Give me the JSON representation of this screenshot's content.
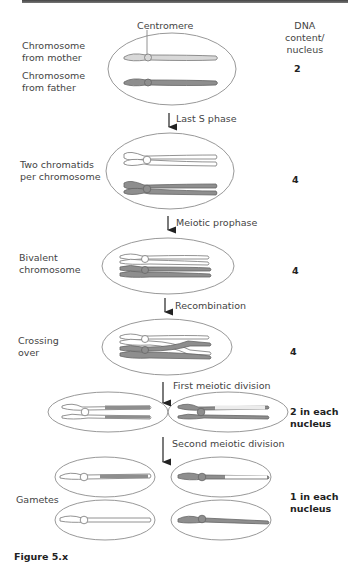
{
  "header": {
    "dna_label": "DNA\ncontent/\nnucleus"
  },
  "labels": {
    "centromere": "Centromere",
    "chrom_mother": "Chromosome\nfrom mother",
    "chrom_father": "Chromosome\nfrom father",
    "two_chromatids": "Two chromatids\nper chromosome",
    "bivalent": "Bivalent\nchromosome",
    "crossing_over": "Crossing\nover",
    "gametes": "Gametes"
  },
  "steps": [
    {
      "label": "Last S phase"
    },
    {
      "label": "Meiotic prophase"
    },
    {
      "label": "Recombination"
    },
    {
      "label": "First meiotic division"
    },
    {
      "label": "Second meiotic division"
    }
  ],
  "dna_content": [
    {
      "stage": "initial",
      "value": "2"
    },
    {
      "stage": "two_chromatids",
      "value": "4"
    },
    {
      "stage": "bivalent",
      "value": "4"
    },
    {
      "stage": "crossing_over",
      "value": "4"
    },
    {
      "stage": "first_division",
      "value": "2 in each\nnucleus"
    },
    {
      "stage": "gametes",
      "value": "1 in each\nnucleus"
    }
  ],
  "colors": {
    "maternal": "#d8d8d8",
    "paternal": "#8e8e8e",
    "outline": "#777777",
    "nucleus_outline": "#999999"
  },
  "caption": "Figure 5.x"
}
